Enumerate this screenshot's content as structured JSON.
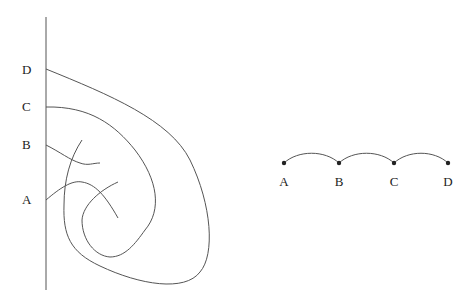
{
  "left_figure": {
    "labels": [
      {
        "text": "D",
        "x": 28,
        "y": 74
      },
      {
        "text": "C",
        "x": 28,
        "y": 111
      },
      {
        "text": "B",
        "x": 28,
        "y": 149
      },
      {
        "text": "A",
        "x": 28,
        "y": 204
      }
    ]
  },
  "right_figure": {
    "nodes": [
      {
        "text": "A",
        "x": 284
      },
      {
        "text": "B",
        "x": 339
      },
      {
        "text": "C",
        "x": 394
      },
      {
        "text": "D",
        "x": 448
      }
    ]
  },
  "colors": {
    "line": "#555555",
    "text": "#222222",
    "node": "#222222"
  }
}
